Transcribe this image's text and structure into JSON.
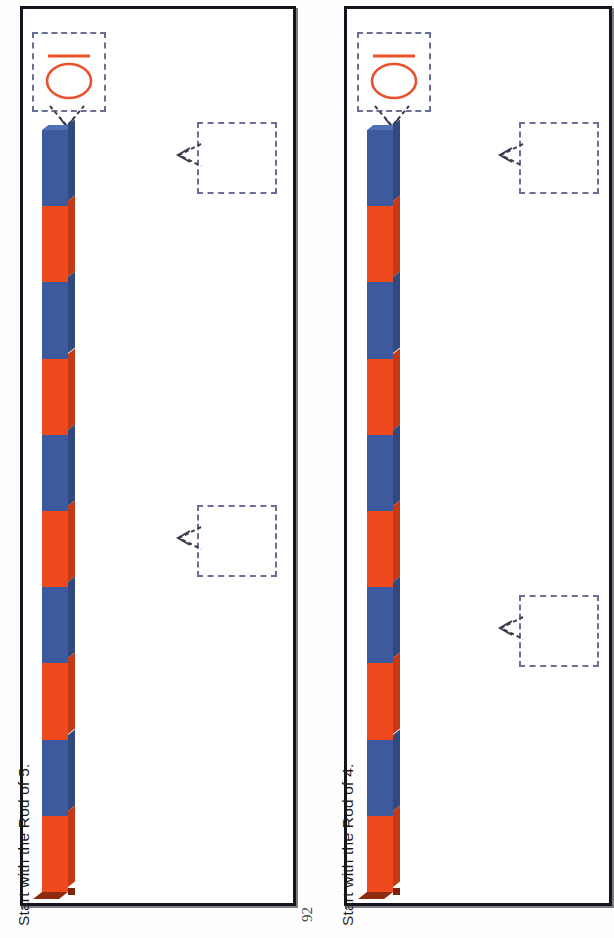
{
  "document": {
    "page_number": "92",
    "orientation": "landscape-rotated"
  },
  "palette": {
    "rod_blue": "#3d5a9e",
    "rod_orange": "#ef4a1e",
    "rod_blue_shadow": "#31497f",
    "rod_orange_shadow": "#c43a16",
    "rod_base": "#8d2a10",
    "panel_border": "#14141e",
    "dashed_border": "#6b6f95",
    "handwriting_ink": "#e8522a",
    "text": "#1b1b1b"
  },
  "panels": [
    {
      "id": "panel-1",
      "caption": "Start with the Rod of 5.",
      "numeral_card": {
        "value": "10",
        "ink_color": "#e8522a",
        "arrow_label": "arrow-down-to-rod"
      },
      "answer_boxes": [
        {
          "id": "answer-box-1-a",
          "value": "",
          "arrow": "arrow-left"
        },
        {
          "id": "answer-box-1-b",
          "value": "",
          "arrow": "arrow-left"
        }
      ],
      "rod": {
        "total_units": 10,
        "segments": [
          "blue",
          "orange",
          "blue",
          "orange",
          "blue",
          "orange",
          "blue",
          "orange",
          "blue",
          "orange"
        ]
      }
    },
    {
      "id": "panel-2",
      "caption": "Start with the Rod of 4.",
      "numeral_card": {
        "value": "10",
        "ink_color": "#e8522a",
        "arrow_label": "arrow-down-to-rod"
      },
      "answer_boxes": [
        {
          "id": "answer-box-2-a",
          "value": "",
          "arrow": "arrow-left"
        },
        {
          "id": "answer-box-2-b",
          "value": "",
          "arrow": "arrow-left"
        }
      ],
      "rod": {
        "total_units": 10,
        "segments": [
          "blue",
          "orange",
          "blue",
          "orange",
          "blue",
          "orange",
          "blue",
          "orange",
          "blue",
          "orange"
        ]
      }
    }
  ]
}
